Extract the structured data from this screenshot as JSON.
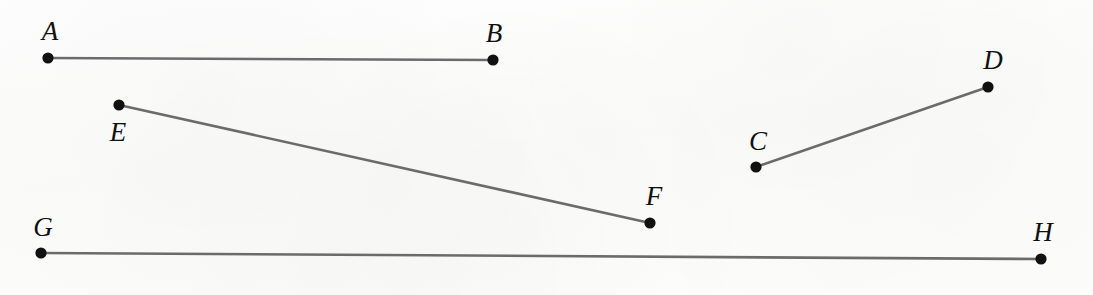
{
  "figure": {
    "background_color": "#fcfcfb",
    "line_color": "#6b6b6b",
    "dot_color": "#111111",
    "label_color": "#111111",
    "line_width": 2.6,
    "dot_radius": 5.6,
    "width": 1093,
    "height": 295
  },
  "chart_data": {
    "type": "scatter",
    "title": "",
    "xlabel": "",
    "ylabel": "",
    "xlim": [
      0,
      1093
    ],
    "ylim": [
      295,
      0
    ],
    "grid": false,
    "legend": "none",
    "points": [
      {
        "label": "A",
        "x": 48,
        "y": 58,
        "label_x": 50,
        "label_y": 40,
        "label_pos": "above-left"
      },
      {
        "label": "B",
        "x": 493,
        "y": 60,
        "label_x": 494,
        "label_y": 42,
        "label_pos": "above-left"
      },
      {
        "label": "C",
        "x": 756,
        "y": 167,
        "label_x": 758,
        "label_y": 150,
        "label_pos": "above"
      },
      {
        "label": "D",
        "x": 988,
        "y": 87,
        "label_x": 993,
        "label_y": 69,
        "label_pos": "above"
      },
      {
        "label": "E",
        "x": 119,
        "y": 105,
        "label_x": 118,
        "label_y": 141,
        "label_pos": "below"
      },
      {
        "label": "F",
        "x": 650,
        "y": 223,
        "label_x": 654,
        "label_y": 205,
        "label_pos": "above"
      },
      {
        "label": "G",
        "x": 41,
        "y": 253,
        "label_x": 43,
        "label_y": 236,
        "label_pos": "above"
      },
      {
        "label": "H",
        "x": 1041,
        "y": 259,
        "label_x": 1043,
        "label_y": 241,
        "label_pos": "above"
      }
    ],
    "segments": [
      {
        "name": "AB",
        "from": "A",
        "from_x": 48,
        "from_y": 58,
        "to": "B",
        "to_x": 493,
        "to_y": 60
      },
      {
        "name": "CD",
        "from": "C",
        "from_x": 756,
        "from_y": 167,
        "to": "D",
        "to_x": 988,
        "to_y": 87
      },
      {
        "name": "EF",
        "from": "E",
        "from_x": 119,
        "from_y": 105,
        "to": "F",
        "to_x": 650,
        "to_y": 223
      },
      {
        "name": "GH",
        "from": "G",
        "from_x": 41,
        "from_y": 253,
        "to": "H",
        "to_x": 1041,
        "to_y": 259
      }
    ]
  }
}
